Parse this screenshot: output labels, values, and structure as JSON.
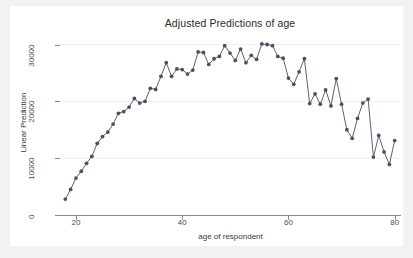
{
  "chart_data": {
    "type": "line",
    "title": "Adjusted Predictions of age",
    "xlabel": "age of respondent",
    "ylabel": "Linear Prediction",
    "xlim": [
      17,
      81
    ],
    "ylim": [
      0,
      31500
    ],
    "xticks": [
      20,
      40,
      60,
      80
    ],
    "yticks": [
      0,
      10000,
      20000,
      30000
    ],
    "ytick_labels": [
      "0",
      "10000",
      "20000",
      "30000"
    ],
    "xtick_labels": [
      "20",
      "40",
      "60",
      "80"
    ],
    "grid": "horizontal",
    "legend": "none",
    "marker": "filled-circle",
    "series_color": "#4a5260",
    "series": [
      {
        "name": "Linear Prediction",
        "x": [
          18,
          19,
          20,
          21,
          22,
          23,
          24,
          25,
          26,
          27,
          28,
          29,
          30,
          31,
          32,
          33,
          34,
          35,
          36,
          37,
          38,
          39,
          40,
          41,
          42,
          43,
          44,
          45,
          46,
          47,
          48,
          49,
          50,
          51,
          52,
          53,
          54,
          55,
          56,
          57,
          58,
          59,
          60,
          61,
          62,
          63,
          64,
          65,
          66,
          67,
          68,
          69,
          70,
          71,
          72,
          73,
          74,
          75,
          76,
          77,
          78,
          79,
          80
        ],
        "values": [
          2800,
          4500,
          6500,
          7700,
          9100,
          10300,
          12600,
          13800,
          14600,
          16000,
          17900,
          18200,
          19000,
          20500,
          19700,
          20000,
          22300,
          22100,
          24400,
          26800,
          24400,
          25700,
          25600,
          24800,
          25500,
          28700,
          28600,
          26500,
          27500,
          27900,
          29800,
          28500,
          27200,
          29200,
          26800,
          28100,
          27400,
          30100,
          30000,
          29800,
          27900,
          27600,
          24100,
          23000,
          25200,
          27500,
          19600,
          21300,
          19500,
          22000,
          19200,
          24000,
          19500,
          15000,
          13500,
          17000,
          19700,
          20400,
          10200,
          14000,
          11100,
          8900,
          13100
        ]
      }
    ]
  },
  "axis": {
    "y_title": "Linear Prediction",
    "x_title": "age of respondent"
  }
}
